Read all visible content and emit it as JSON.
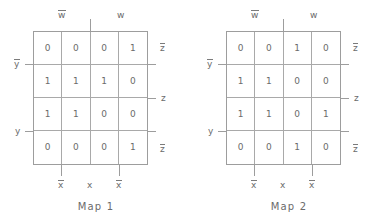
{
  "figure": {
    "line_color": "#9d9d9d",
    "text_color": "#6b6b6b",
    "background": "#ffffff"
  },
  "maps": [
    {
      "caption": "Map 1",
      "top_labels": {
        "left": "w",
        "left_overbar": true,
        "right": "w",
        "right_overbar": false
      },
      "bottom_labels": [
        {
          "text": "x",
          "overbar": true
        },
        {
          "text": "x",
          "overbar": false
        },
        {
          "text": "x",
          "overbar": true
        }
      ],
      "left_labels": [
        {
          "text": "y",
          "overbar": true
        },
        {
          "text": "y",
          "overbar": false
        }
      ],
      "right_labels": [
        {
          "text": "z",
          "overbar": true
        },
        {
          "text": "z",
          "overbar": false
        },
        {
          "text": "z",
          "overbar": true
        }
      ],
      "rows": [
        [
          "0",
          "0",
          "0",
          "1"
        ],
        [
          "1",
          "1",
          "1",
          "0"
        ],
        [
          "1",
          "1",
          "0",
          "0"
        ],
        [
          "0",
          "0",
          "0",
          "1"
        ]
      ]
    },
    {
      "caption": "Map 2",
      "top_labels": {
        "left": "w",
        "left_overbar": true,
        "right": "w",
        "right_overbar": false
      },
      "bottom_labels": [
        {
          "text": "x",
          "overbar": true
        },
        {
          "text": "x",
          "overbar": false
        },
        {
          "text": "x",
          "overbar": true
        }
      ],
      "left_labels": [
        {
          "text": "y",
          "overbar": true
        },
        {
          "text": "y",
          "overbar": false
        }
      ],
      "right_labels": [
        {
          "text": "z",
          "overbar": true
        },
        {
          "text": "z",
          "overbar": false
        },
        {
          "text": "z",
          "overbar": true
        }
      ],
      "rows": [
        [
          "0",
          "0",
          "1",
          "0"
        ],
        [
          "1",
          "1",
          "0",
          "0"
        ],
        [
          "1",
          "1",
          "0",
          "1"
        ],
        [
          "0",
          "0",
          "1",
          "0"
        ]
      ]
    }
  ]
}
